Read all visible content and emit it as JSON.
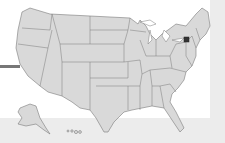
{
  "map": {
    "title": "United States",
    "region": "United States (states)",
    "colors": {
      "state_fill": "#d9d9d9",
      "state_border": "#7a7a7a",
      "background": "#ffffff",
      "frame": "#ececec",
      "marker": "#333333"
    },
    "marker": {
      "label": "New York",
      "icon": "location-dot-icon"
    },
    "insets": [
      "Alaska",
      "Hawaii"
    ]
  }
}
